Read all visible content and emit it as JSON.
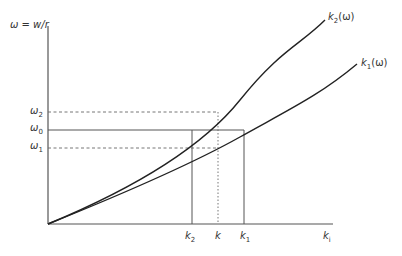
{
  "diagram": {
    "type": "dispersion-relation-diagram",
    "y_axis": {
      "label_symbol": "ω",
      "label_eq": " = w/r"
    },
    "x_axis": {
      "label": "k",
      "label_sub": "i"
    },
    "curves": [
      {
        "id": "k2",
        "label": "k",
        "label_sub": "2",
        "label_tail": "(ω)"
      },
      {
        "id": "k1",
        "label": "k",
        "label_sub": "1",
        "label_tail": "(ω)"
      }
    ],
    "y_ticks": [
      {
        "id": "omega2",
        "symbol": "ω",
        "sub": "2",
        "style": "dashed"
      },
      {
        "id": "omega0",
        "symbol": "ω",
        "sub": "0",
        "style": "solid"
      },
      {
        "id": "omega1",
        "symbol": "ω",
        "sub": "1",
        "style": "dashed"
      }
    ],
    "x_ticks": [
      {
        "id": "k2",
        "symbol": "k",
        "sub": "2",
        "style": "solid"
      },
      {
        "id": "k",
        "symbol": "k",
        "sub": "",
        "style": "dotted"
      },
      {
        "id": "k1",
        "symbol": "k",
        "sub": "1",
        "style": "solid"
      }
    ]
  }
}
